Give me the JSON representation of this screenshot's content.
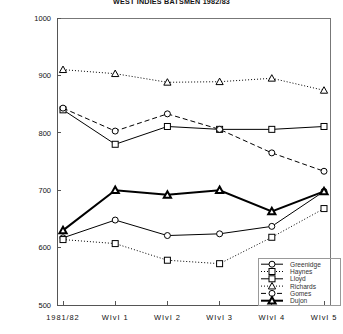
{
  "chart_data": {
    "type": "line",
    "title": "WEST INDIES BATSMEN 1982/83",
    "xlabel": "",
    "ylabel": "",
    "grid": false,
    "legend_position": "bottom-right",
    "ylim": [
      500,
      1000
    ],
    "yticks": [
      500,
      600,
      700,
      800,
      900,
      1000
    ],
    "ytick_labels": [
      "500",
      "600",
      "700",
      "800",
      "900",
      "1000"
    ],
    "categories": [
      "1981/82",
      "WIvI 1",
      "WIvI 2",
      "WIvI 3",
      "WIvI 4",
      "WIvI 5"
    ],
    "series": [
      {
        "name": "Greenidge",
        "marker": "circle",
        "line": "solid",
        "line_width": 1,
        "values": [
          617,
          648,
          621,
          624,
          637,
          698
        ]
      },
      {
        "name": "Haynes",
        "marker": "square",
        "line": "dotted",
        "line_width": 1,
        "values": [
          614,
          607,
          578,
          572,
          618,
          668
        ]
      },
      {
        "name": "Lloyd",
        "marker": "square",
        "line": "solid",
        "line_width": 1,
        "values": [
          840,
          780,
          811,
          806,
          806,
          811
        ]
      },
      {
        "name": "Richards",
        "marker": "triangle",
        "line": "dashdot",
        "line_width": 1,
        "values": [
          910,
          903,
          888,
          889,
          895,
          874
        ]
      },
      {
        "name": "Gomes",
        "marker": "circle",
        "line": "dashed",
        "line_width": 1,
        "values": [
          843,
          803,
          833,
          806,
          765,
          733
        ]
      },
      {
        "name": "Dujon",
        "marker": "triangle",
        "line": "solid",
        "line_width": 2,
        "values": [
          630,
          700,
          692,
          700,
          663,
          698
        ]
      }
    ]
  }
}
